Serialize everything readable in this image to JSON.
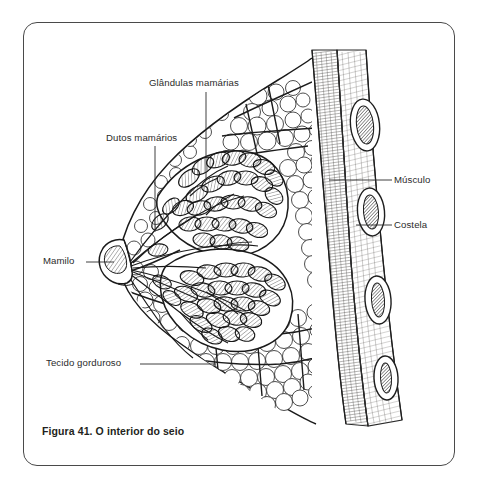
{
  "figure": {
    "caption": "Figura 41. O interior do seio",
    "title_alt": "O interior do seio",
    "number": "Figura 41.",
    "language": "pt-BR"
  },
  "frame": {
    "border_color": "#4a4a4a",
    "background_color": "#ffffff",
    "corner_radius_px": 14
  },
  "illustration": {
    "style": "pen-and-ink medical line drawing",
    "ink_color": "#1a1a1a",
    "fill_color": "#ffffff",
    "structures": [
      "nipple",
      "lactiferous ducts",
      "mammary glands / lobules",
      "adipose (fatty) tissue",
      "suspensory septa",
      "pectoral muscle",
      "ribs"
    ],
    "rib_count": 4
  },
  "annotations": [
    {
      "id": "glandulas",
      "label": "Glândulas mamárias",
      "side": "top",
      "leader": "vertical"
    },
    {
      "id": "dutos",
      "label": "Dutos mamários",
      "side": "left",
      "leader": "vertical"
    },
    {
      "id": "mamilo",
      "label": "Mamilo",
      "side": "left",
      "leader": "horizontal"
    },
    {
      "id": "tecido",
      "label": "Tecido gorduroso",
      "side": "left",
      "leader": "horizontal"
    },
    {
      "id": "musculo",
      "label": "Músculo",
      "side": "right",
      "leader": "horizontal"
    },
    {
      "id": "costela",
      "label": "Costela",
      "side": "right",
      "leader": "horizontal"
    }
  ]
}
